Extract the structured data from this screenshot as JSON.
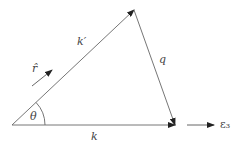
{
  "diagram": {
    "type": "vector-triangle",
    "colors": {
      "stroke": "#555555",
      "arrowhead": "#222222",
      "text": "#444444"
    },
    "vectors": [
      {
        "name": "k_prime",
        "label": "k′",
        "from": [
          12,
          125
        ],
        "to": [
          134,
          10
        ]
      },
      {
        "name": "q",
        "label": "q",
        "from": [
          134,
          10
        ],
        "to": [
          175,
          125
        ]
      },
      {
        "name": "k",
        "label": "k",
        "from": [
          12,
          125
        ],
        "to": [
          175,
          125
        ]
      },
      {
        "name": "e3",
        "label": "ε₃",
        "from": [
          187,
          125
        ],
        "to": [
          214,
          125
        ]
      },
      {
        "name": "r_hat",
        "label": "r̂",
        "from": [
          32,
          86
        ],
        "to": [
          52,
          70
        ]
      }
    ],
    "angle": {
      "label": "θ",
      "vertex": [
        12,
        125
      ]
    }
  }
}
